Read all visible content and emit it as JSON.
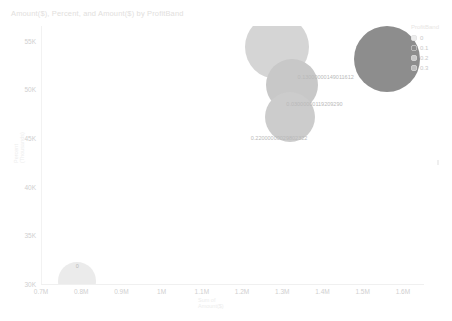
{
  "chart": {
    "title": "Amount($), Percent, and Amount($) by ProfitBand",
    "y_axis_title_line1": "Percent",
    "y_axis_title_line2": "(Thousands)",
    "x_axis_title_line1": "Sum of",
    "x_axis_title_line2": "Amount($)"
  },
  "legend": {
    "title": "ProfitBand",
    "items": [
      {
        "label": "0",
        "color": "#ededed"
      },
      {
        "label": "0.1",
        "color": "#8d8d8d"
      },
      {
        "label": "0.2",
        "color": "#c9c9c9"
      },
      {
        "label": "0.3",
        "color": "#bdbdbd"
      }
    ]
  },
  "chart_data": {
    "type": "scatter",
    "title": "Amount($), Percent, and Amount($) by ProfitBand",
    "xlabel": "Sum of Amount($)",
    "ylabel": "Percent (Thousands)",
    "xlim": [
      700000,
      1650000
    ],
    "ylim": [
      30000,
      56500
    ],
    "x_ticks": [
      "0.7M",
      "0.8M",
      "0.9M",
      "1M",
      "1.1M",
      "1.2M",
      "1.3M",
      "1.4M",
      "1.5M",
      "1.6M"
    ],
    "x_tick_values": [
      700000,
      800000,
      900000,
      1000000,
      1100000,
      1200000,
      1300000,
      1400000,
      1500000,
      1600000
    ],
    "y_ticks": [
      "55K",
      "50K",
      "45K",
      "40K",
      "35K",
      "30K"
    ],
    "y_tick_values": [
      55000,
      50000,
      45000,
      40000,
      35000,
      30000
    ],
    "grid": false,
    "legend_position": "right",
    "points": [
      {
        "label": "0",
        "series": "0",
        "x": 790000,
        "y": 30300,
        "size": 19,
        "color": "#ebebeb",
        "label_x": 790000,
        "label_y": 31900
      },
      {
        "label": "0.13000000149011612",
        "series": "0.2",
        "x": 1287000,
        "y": 54300,
        "size": 32,
        "color": "#d5d5d5",
        "label_x": 1408000,
        "label_y": 51300
      },
      {
        "label": "0.03000000119209290",
        "series": "0.3",
        "x": 1324000,
        "y": 50400,
        "size": 26,
        "color": "#c8c8c8",
        "label_x": 1380000,
        "label_y": 48500
      },
      {
        "label": "0.22000000029802322",
        "series": "0.1",
        "x": 1318000,
        "y": 47200,
        "size": 25,
        "color": "#cccccc",
        "label_x": 1292000,
        "label_y": 45000
      },
      {
        "label": "",
        "series": "0.1",
        "x": 1560000,
        "y": 53100,
        "size": 33,
        "color": "#8d8d8d",
        "label_x": null,
        "label_y": null
      }
    ]
  }
}
